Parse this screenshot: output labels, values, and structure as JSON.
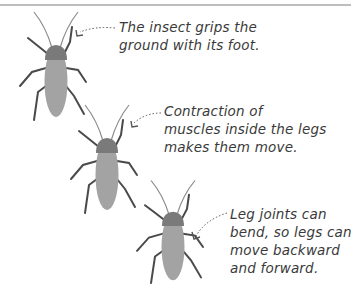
{
  "diagram": {
    "colors": {
      "body": "#a3a3a3",
      "pronotum": "#7a7a7a",
      "legs": "#4a4a4a",
      "antennae": "#888888",
      "text": "#3a3a3a",
      "rule": "#bdbdbd"
    },
    "captions": [
      {
        "id": "grip",
        "lines": [
          "The insect grips the",
          "ground with its foot."
        ]
      },
      {
        "id": "muscles",
        "lines": [
          "Contraction of",
          "muscles inside the legs",
          "makes them move."
        ]
      },
      {
        "id": "joints",
        "lines": [
          "Leg joints can",
          "bend, so legs can",
          "move backward",
          "and forward."
        ]
      }
    ]
  }
}
